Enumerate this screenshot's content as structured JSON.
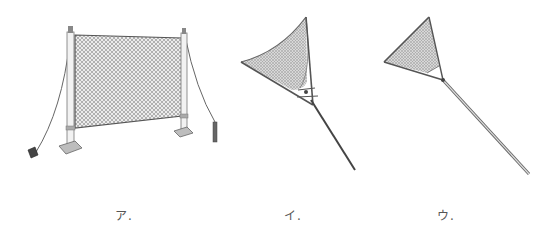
{
  "figures": [
    {
      "id": "a",
      "label": "ア.",
      "description": "chain-link fence net on two posts with guy wires"
    },
    {
      "id": "i",
      "label": "イ.",
      "description": "triangular landing net with curved edge on pole"
    },
    {
      "id": "u",
      "label": "ウ.",
      "description": "triangular hand net on long pole"
    }
  ],
  "colors": {
    "line": "#555555",
    "mesh_fill": "#cfcfcf",
    "background": "#ffffff"
  }
}
